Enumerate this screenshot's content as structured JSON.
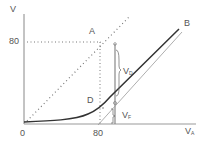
{
  "diagram": {
    "y_axis_label": "V",
    "x_axis_label": "V",
    "x_axis_label_sub": "A",
    "y_tick": "80",
    "x_ticks": [
      "0",
      "80"
    ],
    "point_a": "A",
    "point_b": "B",
    "point_d": "D",
    "vd_label": "V",
    "vd_sub": "D",
    "vf_label": "V",
    "vf_sub": "F",
    "colors": {
      "axis": "#888888",
      "curve": "#333333",
      "dotted": "#777777",
      "text": "#555555"
    }
  }
}
